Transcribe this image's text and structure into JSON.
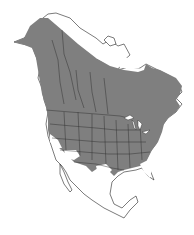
{
  "map": {
    "type": "species range map",
    "region": "North America",
    "colors": {
      "range_fill": "#7f7f7f",
      "land_fill": "#ffffff",
      "borders": "#2a2a2a",
      "background": "#ffffff"
    },
    "legend": []
  }
}
